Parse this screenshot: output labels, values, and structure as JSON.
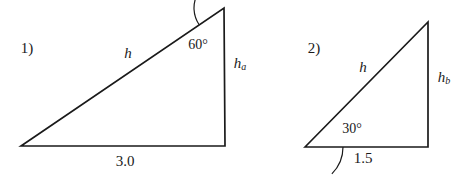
{
  "figure": {
    "background_color": "#ffffff",
    "stroke_color": "#1a1a1a",
    "text_color": "#1a1a1a",
    "problems": [
      {
        "index_label": "1)",
        "index_pos": {
          "x": 27,
          "y": 48
        },
        "triangle": {
          "left_vertex": {
            "x": 21,
            "y": 146
          },
          "apex_vertex": {
            "x": 224,
            "y": 8
          },
          "right_vertex": {
            "x": 225,
            "y": 146
          }
        },
        "angle_arc": {
          "at": "apex",
          "center": {
            "x": 224,
            "y": 8
          },
          "radius": 30,
          "start_deg": 90,
          "end_deg": 214
        },
        "labels": {
          "hypotenuse": {
            "text": "h",
            "sub": "",
            "x": 128,
            "y": 53
          },
          "vertical_side": {
            "text": "h",
            "sub": "a",
            "x": 240,
            "y": 64
          },
          "base": {
            "text": "3.0",
            "x": 125,
            "y": 161
          },
          "angle": {
            "text": "60°",
            "x": 198,
            "y": 45
          }
        }
      },
      {
        "index_label": "2)",
        "index_pos": {
          "x": 314,
          "y": 48
        },
        "triangle": {
          "left_vertex": {
            "x": 305,
            "y": 147
          },
          "apex_vertex": {
            "x": 428,
            "y": 22
          },
          "right_vertex": {
            "x": 428,
            "y": 147
          }
        },
        "angle_arc": {
          "at": "left",
          "center": {
            "x": 305,
            "y": 147
          },
          "radius": 38,
          "start_deg": 0,
          "end_deg": -45
        },
        "labels": {
          "hypotenuse": {
            "text": "h",
            "sub": "",
            "x": 363,
            "y": 67
          },
          "vertical_side": {
            "text": "h",
            "sub": "b",
            "x": 444,
            "y": 78
          },
          "base": {
            "text": "1.5",
            "x": 363,
            "y": 158
          },
          "angle": {
            "text": "30°",
            "x": 352,
            "y": 129
          }
        }
      }
    ]
  }
}
